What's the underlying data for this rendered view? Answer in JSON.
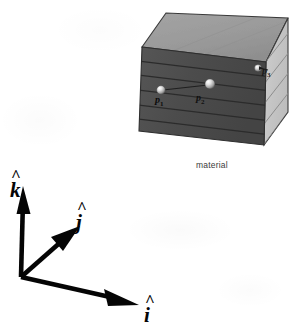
{
  "figure": {
    "caption": "material",
    "description_title": "material-block-with-points",
    "colors": {
      "background": "#ffffff",
      "top_face": "#9a9a9a",
      "front_face": "#4d4d4d",
      "right_face": "#c6c6c6",
      "edge_line": "#2a2a2a",
      "axis": "#050505",
      "sphere_light": "#f2f2f2",
      "sphere_shadow": "#7a7a7a"
    },
    "block": {
      "layer_count_front": 6,
      "stripe_count_right": 6
    }
  },
  "axes": {
    "items": [
      {
        "id": "k",
        "label": "k",
        "hat": "^",
        "direction": "up"
      },
      {
        "id": "j",
        "label": "j",
        "hat": "^",
        "direction": "up-right"
      },
      {
        "id": "i",
        "label": "i",
        "hat": "^",
        "direction": "down-right"
      }
    ],
    "origin_label": "origin"
  },
  "points": [
    {
      "id": "p1",
      "label": "p",
      "subscript": "1",
      "face": "front"
    },
    {
      "id": "p2",
      "label": "p",
      "subscript": "2",
      "face": "front"
    },
    {
      "id": "p3",
      "label": "p",
      "subscript": "3",
      "face": "right"
    }
  ]
}
